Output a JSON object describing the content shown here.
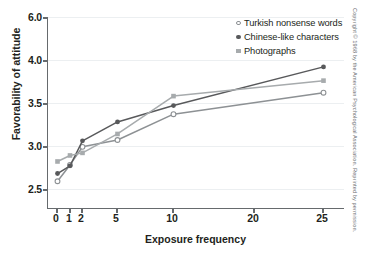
{
  "chart_data": {
    "type": "line",
    "title": "",
    "xlabel": "Exposure frequency",
    "ylabel": "Favorability of attitude",
    "x": [
      0,
      1,
      2,
      5,
      10,
      25
    ],
    "xticks": [
      "0",
      "1",
      "2",
      "5",
      "10",
      "20",
      "25"
    ],
    "xtick_values": [
      0,
      1,
      2,
      5,
      10,
      20,
      25
    ],
    "yticks": [
      "6.0",
      "4.0",
      "3.5",
      "3.0",
      "2.5"
    ],
    "ytick_values": [
      6.0,
      4.0,
      3.5,
      3.0,
      2.5
    ],
    "ylim": [
      2.5,
      6.0
    ],
    "grid": true,
    "legend_position": "top-right",
    "series": [
      {
        "name": "Turkish nonsense words",
        "marker": "open-circle",
        "color": "#8d9194",
        "values": [
          2.59,
          2.78,
          2.99,
          3.07,
          3.37,
          3.62
        ]
      },
      {
        "name": "Chinese-like characters",
        "marker": "filled-circle",
        "color": "#58595b",
        "values": [
          2.68,
          2.77,
          3.06,
          3.28,
          3.47,
          3.92
        ]
      },
      {
        "name": "Photographs",
        "marker": "filled-square",
        "color": "#a7abad",
        "values": [
          2.82,
          2.89,
          2.92,
          3.14,
          3.58,
          3.76
        ]
      }
    ]
  },
  "legend": {
    "entries": [
      {
        "label": "Turkish nonsense words",
        "marker": "open-circle"
      },
      {
        "label": "Chinese-like characters",
        "marker": "filled-circle"
      },
      {
        "label": "Photographs",
        "marker": "filled-square"
      }
    ]
  },
  "credit": {
    "text": "Copyright © 1968 by the American Psychological Association. Reprinted by permission."
  },
  "colors": {
    "axis": "#666a6d",
    "grid": "#eceff1",
    "text": "#231f20",
    "series_light": "#a7abad",
    "series_mid": "#8d9194",
    "series_dark": "#58595b",
    "background": "#ffffff"
  }
}
